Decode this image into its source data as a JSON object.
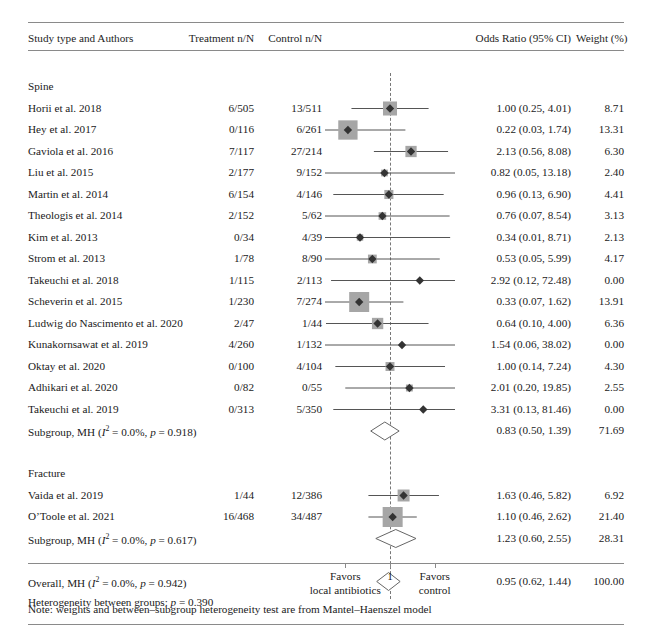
{
  "figure": {
    "type": "forest-plot",
    "title": "",
    "header": {
      "col_study": "Study type and Authors",
      "col_treatment": "Treatment n/N",
      "col_control": "Control n/N",
      "col_or": "Odds Ratio (95% CI)",
      "col_weight": "Weight (%)"
    },
    "axis": {
      "null_value": "1",
      "tick_labels": [
        "",
        "1",
        ""
      ],
      "left_label_line1": "Favors",
      "left_label_line2": "local antibiotics",
      "right_label_line1": "Favors",
      "right_label_line2": "control",
      "scale": "log",
      "xmin": 0.1,
      "xmax": 10
    },
    "note": "Note: weights and between–subgroup heterogeneity test are from Mantel–Haenszel model",
    "heterogeneity_between_groups": "Heterogeneity between groups: p = 0.390",
    "colors": {
      "marker_box": "#a6a6a6",
      "marker_diamond": "#333333",
      "rule": "#8a8a8a",
      "axis": "#777777",
      "text": "#1a1a1a"
    }
  },
  "chart_data": {
    "type": "forest",
    "xlabel": "Odds Ratio (95% CI)",
    "ylabel": "",
    "xscale": "log",
    "xlim": [
      0.1,
      10
    ],
    "reference_line": 1,
    "groups": [
      {
        "name": "Spine",
        "rows": [
          {
            "study": "Horii et al. 2018",
            "treatment": "6/505",
            "control": "13/511",
            "or_text": "1.00 (0.25, 4.01)",
            "or": 1.0,
            "lo": 0.25,
            "hi": 4.01,
            "weight": "8.71",
            "weight_num": 8.71
          },
          {
            "study": "Hey et al. 2017",
            "treatment": "0/116",
            "control": "6/261",
            "or_text": "0.22 (0.03, 1.74)",
            "or": 0.22,
            "lo": 0.03,
            "hi": 1.74,
            "weight": "13.31",
            "weight_num": 13.31
          },
          {
            "study": "Gaviola et al. 2016",
            "treatment": "7/117",
            "control": "27/214",
            "or_text": "2.13 (0.56, 8.08)",
            "or": 2.13,
            "lo": 0.56,
            "hi": 8.08,
            "weight": "6.30",
            "weight_num": 6.3
          },
          {
            "study": "Liu et al. 2015",
            "treatment": "2/177",
            "control": "9/152",
            "or_text": "0.82 (0.05, 13.18)",
            "or": 0.82,
            "lo": 0.05,
            "hi": 13.18,
            "weight": "2.40",
            "weight_num": 2.4
          },
          {
            "study": "Martin et al. 2014",
            "treatment": "6/154",
            "control": "4/146",
            "or_text": "0.96 (0.13, 6.90)",
            "or": 0.96,
            "lo": 0.13,
            "hi": 6.9,
            "weight": "4.41",
            "weight_num": 4.41
          },
          {
            "study": "Theologis et al. 2014",
            "treatment": "2/152",
            "control": "5/62",
            "or_text": "0.76 (0.07, 8.54)",
            "or": 0.76,
            "lo": 0.07,
            "hi": 8.54,
            "weight": "3.13",
            "weight_num": 3.13
          },
          {
            "study": "Kim et al. 2013",
            "treatment": "0/34",
            "control": "4/39",
            "or_text": "0.34 (0.01, 8.71)",
            "or": 0.34,
            "lo": 0.01,
            "hi": 8.71,
            "weight": "2.13",
            "weight_num": 2.13
          },
          {
            "study": "Strom et al. 2013",
            "treatment": "1/78",
            "control": "8/90",
            "or_text": "0.53 (0.05, 5.99)",
            "or": 0.53,
            "lo": 0.05,
            "hi": 5.99,
            "weight": "4.17",
            "weight_num": 4.17
          },
          {
            "study": "Takeuchi et al. 2018",
            "treatment": "1/115",
            "control": "2/113",
            "or_text": "2.92 (0.12, 72.48)",
            "or": 2.92,
            "lo": 0.12,
            "hi": 72.48,
            "weight": "0.00",
            "weight_num": 0.0
          },
          {
            "study": "Scheverin et al. 2015",
            "treatment": "1/230",
            "control": "7/274",
            "or_text": "0.33 (0.07, 1.62)",
            "or": 0.33,
            "lo": 0.07,
            "hi": 1.62,
            "weight": "13.91",
            "weight_num": 13.91
          },
          {
            "study": "Ludwig do Nascimento et al. 2020",
            "treatment": "2/47",
            "control": "1/44",
            "or_text": "0.64 (0.10, 4.00)",
            "or": 0.64,
            "lo": 0.1,
            "hi": 4.0,
            "weight": "6.36",
            "weight_num": 6.36
          },
          {
            "study": "Kunakornsawat et al. 2019",
            "treatment": "4/260",
            "control": "1/132",
            "or_text": "1.54 (0.06, 38.02)",
            "or": 1.54,
            "lo": 0.06,
            "hi": 38.02,
            "weight": "0.00",
            "weight_num": 0.0
          },
          {
            "study": "Oktay et al. 2020",
            "treatment": "0/100",
            "control": "4/104",
            "or_text": "1.00 (0.14, 7.24)",
            "or": 1.0,
            "lo": 0.14,
            "hi": 7.24,
            "weight": "4.30",
            "weight_num": 4.3
          },
          {
            "study": "Adhikari et al. 2020",
            "treatment": "0/82",
            "control": "0/55",
            "or_text": "2.01 (0.20, 19.85)",
            "or": 2.01,
            "lo": 0.2,
            "hi": 19.85,
            "weight": "2.55",
            "weight_num": 2.55
          },
          {
            "study": "Takeuchi et al. 2019",
            "treatment": "0/313",
            "control": "5/350",
            "or_text": "3.31 (0.13, 81.46)",
            "or": 3.31,
            "lo": 0.13,
            "hi": 81.46,
            "weight": "0.00",
            "weight_num": 0.0
          }
        ],
        "summary": {
          "label_prefix": "Subgroup, MH (",
          "label_i2": "I",
          "label_i2_sup": "2",
          "label_mid": " = 0.0%, ",
          "label_p": "p",
          "label_suffix": " = 0.918)",
          "label_plain": "Subgroup, MH (I2 = 0.0%, p = 0.918)",
          "or_text": "0.83 (0.50, 1.39)",
          "or": 0.83,
          "lo": 0.5,
          "hi": 1.39,
          "weight": "71.69"
        }
      },
      {
        "name": "Fracture",
        "rows": [
          {
            "study": "Vaida et al. 2019",
            "treatment": "1/44",
            "control": "12/386",
            "or_text": "1.63 (0.46, 5.82)",
            "or": 1.63,
            "lo": 0.46,
            "hi": 5.82,
            "weight": "6.92",
            "weight_num": 6.92
          },
          {
            "study": "O’Toole et al. 2021",
            "treatment": "16/468",
            "control": "34/487",
            "or_text": "1.10 (0.46, 2.62)",
            "or": 1.1,
            "lo": 0.46,
            "hi": 2.62,
            "weight": "21.40",
            "weight_num": 21.4
          }
        ],
        "summary": {
          "label_prefix": "Subgroup, MH (",
          "label_i2": "I",
          "label_i2_sup": "2",
          "label_mid": " = 0.0%, ",
          "label_p": "p",
          "label_suffix": " = 0.617)",
          "label_plain": "Subgroup, MH (I2 = 0.0%, p = 0.617)",
          "or_text": "1.23 (0.60, 2.55)",
          "or": 1.23,
          "lo": 0.6,
          "hi": 2.55,
          "weight": "28.31"
        }
      }
    ],
    "overall": {
      "label_prefix": "Overall, MH (",
      "label_i2": "I",
      "label_i2_sup": "2",
      "label_mid": " = 0.0%, ",
      "label_p": "p",
      "label_suffix": " = 0.942)",
      "label_plain": "Overall, MH (I2 = 0.0%, p = 0.942)",
      "or_text": "0.95 (0.62, 1.44)",
      "or": 0.95,
      "lo": 0.62,
      "hi": 1.44,
      "weight": "100.00"
    },
    "heterogeneity": {
      "prefix": "Heterogeneity between groups: ",
      "p_italic": "p",
      "suffix": " = 0.390"
    }
  }
}
